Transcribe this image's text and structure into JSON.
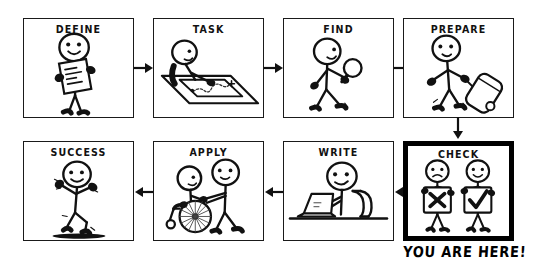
{
  "figure": {
    "type": "process-flowchart-comic",
    "background_color": "#ffffff",
    "stroke_color": "#1a1a1a",
    "highlight_color": "#000000",
    "caption": "YOU ARE HERE!",
    "rows": 2,
    "columns": 4
  },
  "panels": [
    {
      "id": "define",
      "label": "DEFINE",
      "row": 1,
      "order": 1,
      "highlighted": false,
      "scene": "stick-figure-holding-clipboard-with-writing",
      "icon": "clipboard-icon"
    },
    {
      "id": "task",
      "label": "TASK",
      "row": 1,
      "order": 2,
      "highlighted": false,
      "scene": "stick-figure-at-table-studying-map",
      "icon": "map-icon"
    },
    {
      "id": "find",
      "label": "FIND",
      "row": 1,
      "order": 3,
      "highlighted": false,
      "scene": "stick-figure-walking-with-magnifying-glass",
      "icon": "magnifier-icon"
    },
    {
      "id": "prepare",
      "label": "PREPARE",
      "row": 1,
      "order": 4,
      "highlighted": false,
      "scene": "stick-figure-walking-pulling-rolling-suitcase",
      "icon": "suitcase-icon"
    },
    {
      "id": "check",
      "label": "CHECK",
      "row": 2,
      "order": 1,
      "highlighted": true,
      "scene": "two-stick-figures-holding-cross-sign-and-checkmark-sign",
      "icon": "checkmark-icon"
    },
    {
      "id": "write",
      "label": "WRITE",
      "row": 2,
      "order": 2,
      "highlighted": false,
      "scene": "stick-figure-seated-at-desk-typing-on-laptop",
      "icon": "laptop-icon"
    },
    {
      "id": "apply",
      "label": "APPLY",
      "row": 2,
      "order": 3,
      "highlighted": false,
      "scene": "stick-figure-pushing-another-in-wheelchair",
      "icon": "wheelchair-icon"
    },
    {
      "id": "success",
      "label": "SUCCESS",
      "row": 2,
      "order": 4,
      "highlighted": false,
      "scene": "stick-figure-running-with-arms-raised-celebrating",
      "icon": "celebration-icon"
    }
  ],
  "connectors": [
    {
      "id": "define-to-task",
      "direction": "right",
      "from": "define",
      "to": "task"
    },
    {
      "id": "task-to-find",
      "direction": "right",
      "from": "task",
      "to": "find"
    },
    {
      "id": "find-to-prepare",
      "direction": "right",
      "from": "find",
      "to": "prepare"
    },
    {
      "id": "prepare-to-check",
      "direction": "down",
      "from": "prepare",
      "to": "check"
    },
    {
      "id": "check-to-write",
      "direction": "left",
      "from": "check",
      "to": "write"
    },
    {
      "id": "write-to-apply",
      "direction": "left",
      "from": "write",
      "to": "apply"
    },
    {
      "id": "apply-to-success",
      "direction": "left",
      "from": "apply",
      "to": "success"
    }
  ],
  "caption": {
    "text": "YOU ARE HERE!",
    "attached_to": "check"
  }
}
